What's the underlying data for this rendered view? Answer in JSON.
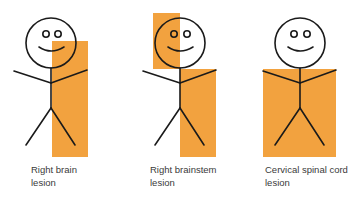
{
  "colors": {
    "highlight": "#F2A23F",
    "stroke": "#1a1a1a"
  },
  "figures": [
    {
      "id": "right-brain",
      "label_line1": "Right brain",
      "label_line2": "lesion"
    },
    {
      "id": "right-brainstem",
      "label_line1": "Right brainstem",
      "label_line2": "lesion"
    },
    {
      "id": "cervical-spinal-cord",
      "label_line1": "Cervical spinal cord",
      "label_line2": "lesion"
    }
  ]
}
